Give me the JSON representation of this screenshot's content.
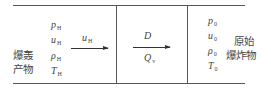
{
  "left_region": {
    "label_lines": [
      "爆轰",
      "产物"
    ],
    "variables": [
      {
        "symbol": "p",
        "sub": "H"
      },
      {
        "symbol": "u",
        "sub": "H"
      },
      {
        "symbol": "ρ",
        "sub": "H"
      },
      {
        "symbol": "T",
        "sub": "H"
      }
    ],
    "arrow_label": {
      "symbol": "u",
      "sub": "H"
    }
  },
  "middle_region": {
    "arrow_top_label": "D",
    "arrow_bottom_label": {
      "symbol": "Q",
      "sub": "v"
    }
  },
  "right_region": {
    "label_lines": [
      "原始",
      "爆炸物"
    ],
    "variables": [
      {
        "symbol": "p",
        "sub": "0"
      },
      {
        "symbol": "u",
        "sub": "0"
      },
      {
        "symbol": "ρ",
        "sub": "0"
      },
      {
        "symbol": "T",
        "sub": "0"
      }
    ]
  }
}
